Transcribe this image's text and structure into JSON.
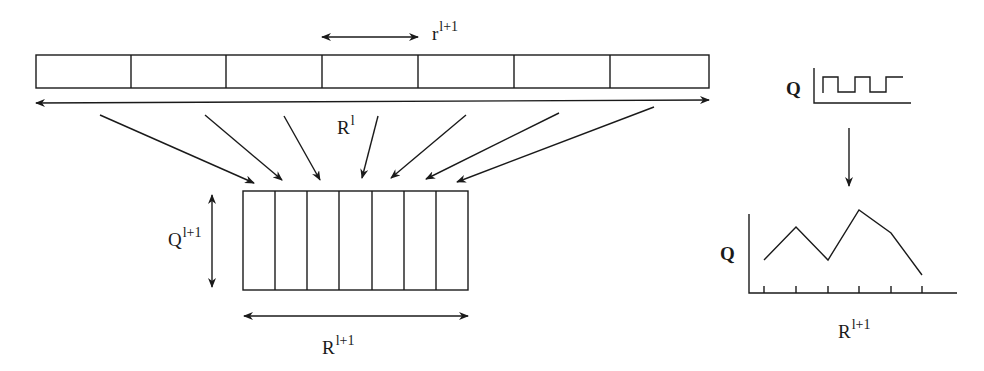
{
  "labels": {
    "window_size": {
      "base": "r",
      "sup": "l+1"
    },
    "input_length": {
      "base": "R",
      "sup": "l"
    },
    "output_height": {
      "base": "Q",
      "sup": "l+1"
    },
    "output_length": {
      "base": "R",
      "sup": "l+1"
    },
    "square_wave_axis": "Q",
    "line_plot_y": "Q",
    "line_plot_x": {
      "base": "R",
      "sup": "l+1"
    }
  },
  "input_strip": {
    "cells": 7
  },
  "output_grid": {
    "columns": 7
  },
  "line_plot": {
    "ticks": 6,
    "points": [
      0.55,
      0.85,
      0.55,
      1.0,
      0.8,
      0.15
    ]
  },
  "colors": {
    "stroke": "#1a1a1a",
    "background": "#ffffff"
  }
}
